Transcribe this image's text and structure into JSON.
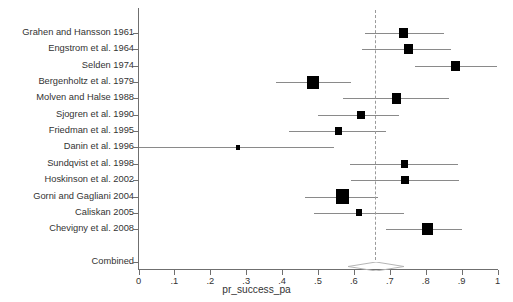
{
  "chart_data": {
    "type": "forest",
    "title": "",
    "xlabel": "pr_success_pa",
    "ylabel": "",
    "xlim": [
      0,
      1
    ],
    "xticks": [
      "0",
      ".1",
      ".2",
      ".3",
      ".4",
      ".5",
      ".6",
      ".7",
      ".8",
      ".9",
      "1"
    ],
    "xtick_values": [
      0,
      0.1,
      0.2,
      0.3,
      0.4,
      0.5,
      0.6,
      0.7,
      0.8,
      0.9,
      1
    ],
    "grid": false,
    "legend": "none",
    "reference_line": 0.66,
    "categories": [
      "Grahen and Hansson 1961",
      "Engstrom et al. 1964",
      "Selden 1974",
      "Bergenholtz et al. 1979",
      "Molven and Halse 1988",
      "Sjogren et al. 1990",
      "Friedman et al. 1995",
      "Danin et al. 1996",
      "Sundqvist et al. 1998",
      "Hoskinson et al. 2002",
      "Gorni and Gagliani 2004",
      "Caliskan 2005",
      "Chevigny et al. 2008",
      "Combined"
    ],
    "studies": [
      {
        "label": "Grahen and Hansson 1961",
        "estimate": 0.738,
        "ci_low": 0.632,
        "ci_high": 0.851,
        "weight": 0.55
      },
      {
        "label": "Engstrom et al. 1964",
        "estimate": 0.752,
        "ci_low": 0.623,
        "ci_high": 0.871,
        "weight": 0.6
      },
      {
        "label": "Selden 1974",
        "estimate": 0.884,
        "ci_low": 0.771,
        "ci_high": 1.0,
        "weight": 0.55
      },
      {
        "label": "Bergenholtz et al. 1979",
        "estimate": 0.486,
        "ci_low": 0.382,
        "ci_high": 0.592,
        "weight": 0.85
      },
      {
        "label": "Molven and Halse 1988",
        "estimate": 0.718,
        "ci_low": 0.57,
        "ci_high": 0.866,
        "weight": 0.6
      },
      {
        "label": "Sjogren et al. 1990",
        "estimate": 0.62,
        "ci_low": 0.5,
        "ci_high": 0.725,
        "weight": 0.42
      },
      {
        "label": "Friedman et al. 1995",
        "estimate": 0.556,
        "ci_low": 0.42,
        "ci_high": 0.69,
        "weight": 0.38
      },
      {
        "label": "Danin et al. 1996",
        "estimate": 0.277,
        "ci_low": 0.0,
        "ci_high": 0.545,
        "weight": 0.12
      },
      {
        "label": "Sundqvist et al. 1998",
        "estimate": 0.74,
        "ci_low": 0.59,
        "ci_high": 0.89,
        "weight": 0.4
      },
      {
        "label": "Hoskinson et al. 2002",
        "estimate": 0.743,
        "ci_low": 0.593,
        "ci_high": 0.893,
        "weight": 0.42
      },
      {
        "label": "Gorni and Gagliani 2004",
        "estimate": 0.567,
        "ci_low": 0.463,
        "ci_high": 0.666,
        "weight": 1.0
      },
      {
        "label": "Caliskan 2005",
        "estimate": 0.615,
        "ci_low": 0.488,
        "ci_high": 0.74,
        "weight": 0.3
      },
      {
        "label": "Chevigny et al. 2008",
        "estimate": 0.805,
        "ci_low": 0.69,
        "ci_high": 0.9,
        "weight": 0.72
      }
    ],
    "combined": {
      "label": "Combined",
      "estimate": 0.662,
      "ci_low": 0.584,
      "ci_high": 0.74
    }
  },
  "axis": {
    "x_title": "pr_success_pa"
  },
  "colors": {
    "marker": "#000000",
    "ci_line": "#8a8a8a",
    "axis": "#6f6f6f",
    "reference": "#9a9a9a",
    "diamond": "#b5b5b5",
    "text": "#333333",
    "background": "#ffffff"
  }
}
